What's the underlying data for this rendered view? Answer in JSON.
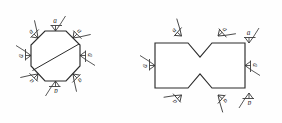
{
  "document": {
    "title": "Surface Finish Annotation Drawing",
    "background_color": "#fefefe",
    "line_color": "#2b2b2b",
    "symbol_color": "#2f2f2f",
    "text_color": "#242424",
    "width": 282,
    "height": 123
  },
  "figures": [
    {
      "id": "figure-left",
      "name": "octagon-part",
      "shape": "octagon-with-diagonal",
      "description": "Regular octagon with a diagonal parting line from lower-left to upper-right, annotated with eight surface finish symbols.",
      "annotation_count": 8
    },
    {
      "id": "figure-right",
      "name": "notched-rectangle-part",
      "shape": "rectangle-with-v-notches",
      "description": "Rectangle with V-shaped notches cut into the top and bottom edges forming an hourglass waist, annotated with eight surface finish symbols.",
      "annotation_count": 8
    }
  ],
  "annotations": {
    "symbol_type": "surface-finish-check-mark",
    "left_figure": [
      {
        "label": "a",
        "position": "top-left-facet"
      },
      {
        "label": "a",
        "position": "top-facet"
      },
      {
        "label": "a",
        "position": "top-right-facet"
      },
      {
        "label": "a",
        "position": "left-facet"
      },
      {
        "label": "a",
        "position": "right-facet"
      },
      {
        "label": "a",
        "position": "bottom-left-facet"
      },
      {
        "label": "a",
        "position": "bottom-facet"
      },
      {
        "label": "a",
        "position": "bottom-right-facet"
      }
    ],
    "right_figure": [
      {
        "label": "a",
        "position": "top-left-notch-flank"
      },
      {
        "label": "a",
        "position": "top-right-notch-flank"
      },
      {
        "label": "a",
        "position": "top-right-edge"
      },
      {
        "label": "a",
        "position": "left-edge"
      },
      {
        "label": "a",
        "position": "right-edge"
      },
      {
        "label": "a",
        "position": "bottom-left-notch-flank"
      },
      {
        "label": "a",
        "position": "bottom-right-notch-flank"
      },
      {
        "label": "a",
        "position": "bottom-right-edge"
      }
    ]
  }
}
